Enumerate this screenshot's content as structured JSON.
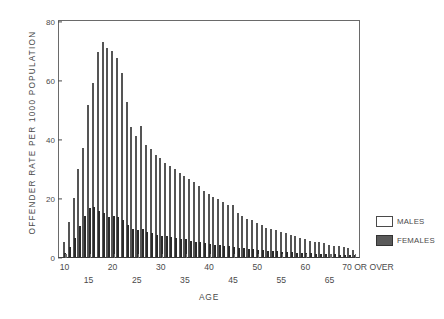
{
  "chart_data": {
    "type": "bar",
    "title": "",
    "xlabel": "AGE",
    "ylabel": "OFFENDER RATE PER 1000 POPULATION",
    "ylim": [
      0,
      80
    ],
    "yticks": [
      0,
      20,
      40,
      60,
      80
    ],
    "grid": false,
    "legend_position": "right",
    "categories": [
      "10",
      "11",
      "12",
      "13",
      "14",
      "15",
      "16",
      "17",
      "18",
      "19",
      "20",
      "21",
      "22",
      "23",
      "24",
      "25",
      "26",
      "27",
      "28",
      "29",
      "30",
      "31",
      "32",
      "33",
      "34",
      "35",
      "36",
      "37",
      "38",
      "39",
      "40",
      "41",
      "42",
      "43",
      "44",
      "45",
      "46",
      "47",
      "48",
      "49",
      "50",
      "51",
      "52",
      "53",
      "54",
      "55",
      "56",
      "57",
      "58",
      "59",
      "60",
      "61",
      "62",
      "63",
      "64",
      "65",
      "66",
      "67",
      "68",
      "69",
      "70 OR OVER"
    ],
    "series": [
      {
        "name": "MALES",
        "color": "#ffffff",
        "values": [
          5.0,
          12.0,
          20.0,
          30.0,
          37.0,
          51.5,
          59.0,
          69.5,
          73.0,
          71.0,
          70.0,
          67.5,
          62.5,
          52.5,
          44.0,
          41.0,
          44.5,
          38.0,
          36.5,
          34.5,
          33.5,
          32.0,
          31.0,
          30.0,
          28.5,
          27.5,
          26.5,
          25.5,
          24.0,
          22.5,
          21.5,
          20.5,
          19.5,
          18.5,
          17.5,
          17.5,
          15.0,
          14.0,
          13.0,
          12.5,
          11.5,
          11.0,
          10.0,
          9.5,
          9.0,
          8.5,
          8.0,
          7.5,
          7.0,
          6.5,
          6.0,
          5.5,
          5.2,
          5.0,
          4.6,
          4.2,
          3.9,
          3.6,
          3.3,
          3.0,
          2.4
        ]
      },
      {
        "name": "FEMALES",
        "color": "#4e4e4e",
        "values": [
          1.5,
          3.5,
          6.5,
          10.5,
          14.0,
          16.5,
          17.0,
          15.5,
          15.0,
          13.5,
          14.0,
          13.5,
          12.5,
          11.0,
          9.5,
          9.0,
          9.5,
          8.5,
          8.0,
          7.5,
          7.2,
          7.0,
          6.8,
          6.5,
          6.2,
          6.0,
          5.5,
          5.2,
          5.0,
          4.7,
          4.5,
          4.2,
          4.0,
          3.8,
          3.6,
          3.5,
          3.2,
          3.0,
          2.8,
          2.6,
          2.5,
          2.3,
          2.1,
          2.0,
          1.9,
          1.8,
          1.7,
          1.6,
          1.5,
          1.4,
          1.3,
          1.2,
          1.1,
          1.05,
          1.0,
          0.95,
          0.9,
          0.85,
          0.8,
          0.75,
          0.6
        ]
      }
    ],
    "axis": {
      "y_title": "OFFENDER RATE PER 1000 POPULATION",
      "x_title": "AGE",
      "x_tick_labels_upper": [
        "10",
        "20",
        "30",
        "40",
        "50",
        "60",
        "70 OR OVER"
      ],
      "x_tick_labels_lower": [
        "15",
        "25",
        "35",
        "45",
        "55",
        "65"
      ],
      "y_tick_labels": [
        "0",
        "20",
        "40",
        "60",
        "80"
      ]
    },
    "legend": [
      {
        "label": "MALES",
        "swatch": "males-swatch"
      },
      {
        "label": "FEMALES",
        "swatch": "females-swatch"
      }
    ]
  }
}
